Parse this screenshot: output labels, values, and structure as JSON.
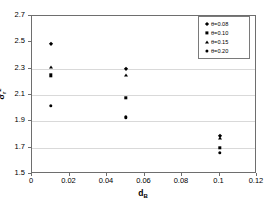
{
  "chart_data": {
    "type": "scatter",
    "title": "",
    "xlabel": "d_B",
    "xlabel_base": "d",
    "xlabel_sub": "B",
    "ylabel": "σ_r²",
    "ylabel_base": "σ",
    "ylabel_sub": "r",
    "ylabel_sup": "2",
    "xlim": [
      0,
      0.12
    ],
    "ylim": [
      1.5,
      2.7
    ],
    "xticks": [
      "0",
      "0.02",
      "0.04",
      "0.06",
      "0.08",
      "0.1",
      "0.12"
    ],
    "xtick_values": [
      0,
      0.02,
      0.04,
      0.06,
      0.08,
      0.1,
      0.12
    ],
    "yticks": [
      "1.5",
      "1.7",
      "1.9",
      "2.1",
      "2.3",
      "2.5",
      "2.7"
    ],
    "ytick_values": [
      1.5,
      1.7,
      1.9,
      2.1,
      2.3,
      2.5,
      2.7
    ],
    "grid": "horizontal",
    "gridlines": [
      1.7,
      1.9,
      2.1,
      2.3
    ],
    "grid_color": "#d9d9d9",
    "frame_color": "#6e6e6e",
    "marker_color": "#000000",
    "background": "#ffffff",
    "legend_position": "top-right",
    "series": [
      {
        "name": "θ=0.08",
        "marker": "diamond",
        "points": [
          {
            "x": 0.01,
            "y": 2.49
          },
          {
            "x": 0.05,
            "y": 2.3
          },
          {
            "x": 0.1,
            "y": 1.79
          }
        ]
      },
      {
        "name": "θ=0.10",
        "marker": "square",
        "points": [
          {
            "x": 0.01,
            "y": 2.25
          },
          {
            "x": 0.05,
            "y": 2.08
          },
          {
            "x": 0.1,
            "y": 1.7
          }
        ]
      },
      {
        "name": "θ=0.15",
        "marker": "triangle",
        "points": [
          {
            "x": 0.01,
            "y": 2.31
          },
          {
            "x": 0.05,
            "y": 2.25
          },
          {
            "x": 0.1,
            "y": 1.77
          }
        ]
      },
      {
        "name": "θ=0.20",
        "marker": "circle",
        "points": [
          {
            "x": 0.01,
            "y": 2.02
          },
          {
            "x": 0.05,
            "y": 1.93
          },
          {
            "x": 0.1,
            "y": 1.66
          }
        ]
      }
    ]
  }
}
